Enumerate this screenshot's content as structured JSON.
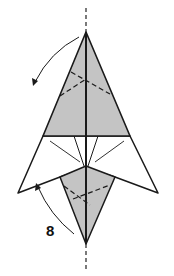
{
  "diagram": {
    "type": "origami-fold-diagram",
    "step_number": "8",
    "colors": {
      "paper_colored": "#c4c4c4",
      "paper_white": "#ffffff",
      "line": "#1a1a1a"
    },
    "elements": [
      "vertical dashed center axis",
      "upper gray triangle with valley-fold dashed lines",
      "white wing flaps left and right",
      "lower gray kite with dashed fold lines",
      "curved arrow top-left pointing down",
      "curved arrow bottom-left pointing up"
    ]
  }
}
